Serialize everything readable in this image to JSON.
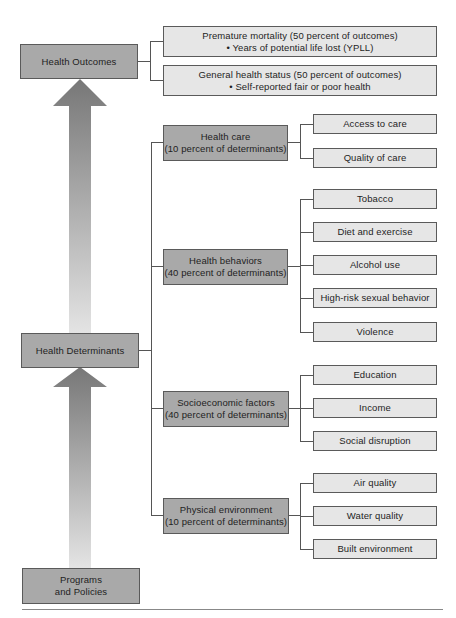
{
  "diagram": {
    "main_nodes": {
      "outcomes": "Health Outcomes",
      "determinants": "Health Determinants",
      "programs_line1": "Programs",
      "programs_line2": "and Policies"
    },
    "outcomes": [
      {
        "title": "Premature mortality (50 percent of outcomes)",
        "bullet": "• Years of potential life lost (YPLL)"
      },
      {
        "title": "General health status (50 percent of outcomes)",
        "bullet": "• Self-reported fair or poor health"
      }
    ],
    "determinants": [
      {
        "name": "Health care",
        "share": "(10 percent of determinants)",
        "items": [
          "Access to care",
          "Quality of care"
        ]
      },
      {
        "name": "Health behaviors",
        "share": "(40 percent of determinants)",
        "items": [
          "Tobacco",
          "Diet and exercise",
          "Alcohol use",
          "High-risk sexual behavior",
          "Violence"
        ]
      },
      {
        "name": "Socioeconomic factors",
        "share": "(40 percent of determinants)",
        "items": [
          "Education",
          "Income",
          "Social disruption"
        ]
      },
      {
        "name": "Physical environment",
        "share": "(10 percent of determinants)",
        "items": [
          "Air quality",
          "Water quality",
          "Built environment"
        ]
      }
    ],
    "colors": {
      "dark_box": "#a9a9a9",
      "light_box": "#e6e6e6",
      "arrow": "#7d7d7d",
      "line": "#555555"
    }
  }
}
